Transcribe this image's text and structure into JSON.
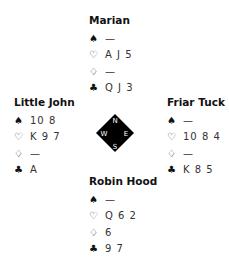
{
  "hands": {
    "north": {
      "player": "Marian",
      "suits": [
        {
          "suit": "spades",
          "icon": "♠",
          "cards": "—"
        },
        {
          "suit": "hearts",
          "icon": "♡",
          "cards": "A J 5"
        },
        {
          "suit": "diamonds",
          "icon": "♢",
          "cards": "—"
        },
        {
          "suit": "clubs",
          "icon": "♣",
          "cards": "Q J 3"
        }
      ]
    },
    "west": {
      "player": "Little John",
      "suits": [
        {
          "suit": "spades",
          "icon": "♠",
          "cards": "10 8"
        },
        {
          "suit": "hearts",
          "icon": "♡",
          "cards": "K 9 7"
        },
        {
          "suit": "diamonds",
          "icon": "♢",
          "cards": "—"
        },
        {
          "suit": "clubs",
          "icon": "♣",
          "cards": "A"
        }
      ]
    },
    "east": {
      "player": "Friar Tuck",
      "suits": [
        {
          "suit": "spades",
          "icon": "♠",
          "cards": "—"
        },
        {
          "suit": "hearts",
          "icon": "♡",
          "cards": "10 8 4"
        },
        {
          "suit": "diamonds",
          "icon": "♢",
          "cards": "—"
        },
        {
          "suit": "clubs",
          "icon": "♣",
          "cards": "K 8 5"
        }
      ]
    },
    "south": {
      "player": "Robin Hood",
      "suits": [
        {
          "suit": "spades",
          "icon": "♠",
          "cards": "—"
        },
        {
          "suit": "hearts",
          "icon": "♡",
          "cards": "Q 6 2"
        },
        {
          "suit": "diamonds",
          "icon": "♢",
          "cards": "6"
        },
        {
          "suit": "clubs",
          "icon": "♣",
          "cards": "9 7"
        }
      ]
    }
  },
  "compass": {
    "n": "N",
    "e": "E",
    "s": "S",
    "w": "W",
    "fill": "#000000",
    "text_color": "#ffffff"
  }
}
